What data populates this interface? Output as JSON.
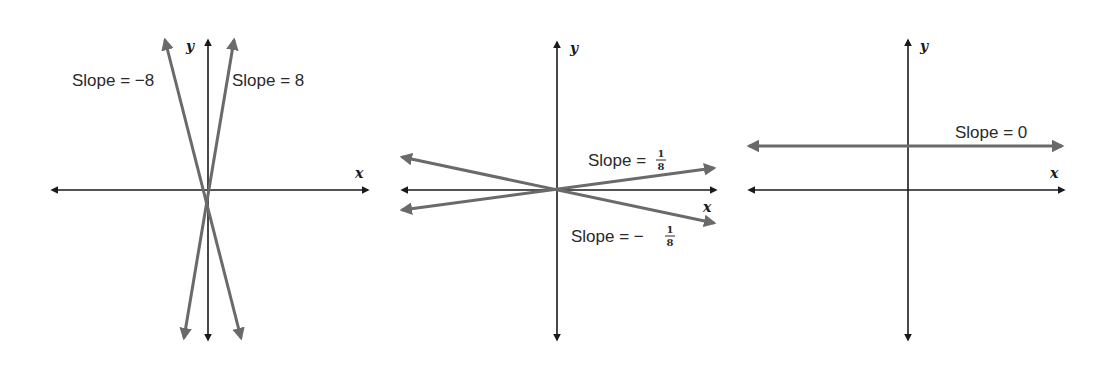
{
  "colors": {
    "axis": "#1a1a1a",
    "line": "#6a6a6a",
    "background": "#ffffff"
  },
  "panels": [
    {
      "id": "steep",
      "axis_labels": {
        "x": "x",
        "y": "y"
      },
      "lines": [
        {
          "slope_text": "Slope = −8",
          "slope": -8
        },
        {
          "slope_text": "Slope = 8",
          "slope": 8
        }
      ]
    },
    {
      "id": "shallow",
      "axis_labels": {
        "x": "x",
        "y": "y"
      },
      "lines": [
        {
          "slope_prefix": "Slope = ",
          "slope_num": "1",
          "slope_den": "8",
          "slope": 0.125
        },
        {
          "slope_prefix": "Slope = −",
          "slope_num": "1",
          "slope_den": "8",
          "slope": -0.125
        }
      ]
    },
    {
      "id": "flat",
      "axis_labels": {
        "x": "x",
        "y": "y"
      },
      "lines": [
        {
          "slope_text": "Slope = 0",
          "slope": 0
        }
      ]
    }
  ]
}
